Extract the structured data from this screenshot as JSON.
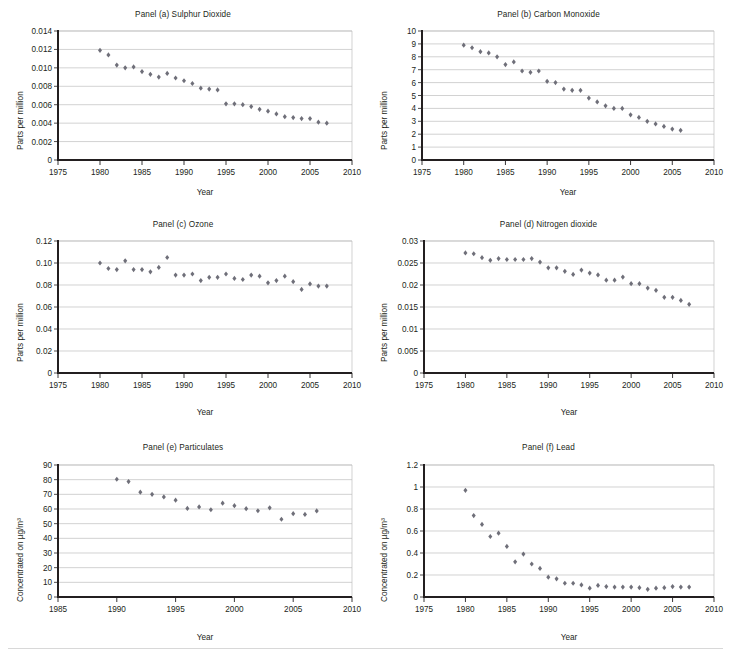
{
  "figure": {
    "axis_label_x": "Year",
    "marker_color": "#6f6f79",
    "axis_color": "#231f20",
    "grid_color": "#bfbfbf"
  },
  "chart_data": [
    {
      "id": "panel-a",
      "type": "scatter",
      "title": "Panel (a) Sulphur Dioxide",
      "xlabel": "Year",
      "ylabel": "Parts per million",
      "xlim": [
        1975,
        2010
      ],
      "ylim": [
        0,
        0.014
      ],
      "xticks": [
        1975,
        1980,
        1985,
        1990,
        1995,
        2000,
        2005,
        2010
      ],
      "yticks": [
        0,
        0.002,
        0.004,
        0.006,
        0.008,
        0.01,
        0.012,
        0.014
      ],
      "ytick_labels": [
        "0",
        "0.002",
        "0.004",
        "0.006",
        "0.008",
        "0.010",
        "0.012",
        "0.014"
      ],
      "grid": true,
      "legend": "none",
      "x": [
        1980,
        1981,
        1982,
        1983,
        1984,
        1985,
        1986,
        1987,
        1988,
        1989,
        1990,
        1991,
        1992,
        1993,
        1994,
        1995,
        1996,
        1997,
        1998,
        1999,
        2000,
        2001,
        2002,
        2003,
        2004,
        2005,
        2006,
        2007
      ],
      "y": [
        0.0119,
        0.0114,
        0.0103,
        0.01,
        0.0101,
        0.0096,
        0.0093,
        0.009,
        0.0094,
        0.0089,
        0.0086,
        0.0083,
        0.0078,
        0.0077,
        0.0076,
        0.0061,
        0.0061,
        0.006,
        0.0058,
        0.0055,
        0.0053,
        0.005,
        0.0047,
        0.0046,
        0.0045,
        0.0045,
        0.0041,
        0.004
      ]
    },
    {
      "id": "panel-b",
      "type": "scatter",
      "title": "Panel (b) Carbon Monoxide",
      "xlabel": "Year",
      "ylabel": "Parts per million",
      "xlim": [
        1975,
        2010
      ],
      "ylim": [
        0,
        10
      ],
      "xticks": [
        1975,
        1980,
        1985,
        1990,
        1995,
        2000,
        2005,
        2010
      ],
      "yticks": [
        0,
        1,
        2,
        3,
        4,
        5,
        6,
        7,
        8,
        9,
        10
      ],
      "ytick_labels": [
        "0",
        "1",
        "2",
        "3",
        "4",
        "5",
        "6",
        "7",
        "8",
        "9",
        "10"
      ],
      "grid": true,
      "legend": "none",
      "x": [
        1980,
        1981,
        1982,
        1983,
        1984,
        1985,
        1986,
        1987,
        1988,
        1989,
        1990,
        1991,
        1992,
        1993,
        1994,
        1995,
        1996,
        1997,
        1998,
        1999,
        2000,
        2001,
        2002,
        2003,
        2004,
        2005,
        2006
      ],
      "y": [
        8.9,
        8.7,
        8.4,
        8.3,
        8.0,
        7.4,
        7.6,
        6.9,
        6.8,
        6.9,
        6.1,
        6.0,
        5.5,
        5.4,
        5.4,
        4.8,
        4.5,
        4.2,
        4.0,
        4.0,
        3.5,
        3.3,
        3.0,
        2.8,
        2.6,
        2.4,
        2.3
      ]
    },
    {
      "id": "panel-c",
      "type": "scatter",
      "title": "Panel (c) Ozone",
      "xlabel": "Year",
      "ylabel": "Parts per million",
      "xlim": [
        1975,
        2010
      ],
      "ylim": [
        0,
        0.12
      ],
      "xticks": [
        1975,
        1980,
        1985,
        1990,
        1995,
        2000,
        2005,
        2010
      ],
      "yticks": [
        0,
        0.02,
        0.04,
        0.06,
        0.08,
        0.1,
        0.12
      ],
      "ytick_labels": [
        "0",
        "0.02",
        "0.04",
        "0.06",
        "0.08",
        "0.10",
        "0.12"
      ],
      "grid": true,
      "legend": "none",
      "x": [
        1980,
        1981,
        1982,
        1983,
        1984,
        1985,
        1986,
        1987,
        1988,
        1989,
        1990,
        1991,
        1992,
        1993,
        1994,
        1995,
        1996,
        1997,
        1998,
        1999,
        2000,
        2001,
        2002,
        2003,
        2004,
        2005,
        2006,
        2007
      ],
      "y": [
        0.1,
        0.095,
        0.094,
        0.102,
        0.094,
        0.094,
        0.092,
        0.096,
        0.105,
        0.089,
        0.089,
        0.09,
        0.084,
        0.087,
        0.087,
        0.09,
        0.086,
        0.085,
        0.089,
        0.088,
        0.082,
        0.084,
        0.088,
        0.083,
        0.076,
        0.081,
        0.079,
        0.079
      ]
    },
    {
      "id": "panel-d",
      "type": "scatter",
      "title": "Panel (d) Nitrogen dioxide",
      "xlabel": "Year",
      "ylabel": "Parts per million",
      "xlim": [
        1975,
        2010
      ],
      "ylim": [
        0,
        0.03
      ],
      "xticks": [
        1975,
        1980,
        1985,
        1990,
        1995,
        2000,
        2005,
        2010
      ],
      "yticks": [
        0,
        0.005,
        0.01,
        0.015,
        0.02,
        0.025,
        0.03
      ],
      "ytick_labels": [
        "0",
        "0.005",
        "0.01",
        "0.015",
        "0.02",
        "0.025",
        "0.03"
      ],
      "grid": true,
      "legend": "none",
      "x": [
        1980,
        1981,
        1982,
        1983,
        1984,
        1985,
        1986,
        1987,
        1988,
        1989,
        1990,
        1991,
        1992,
        1993,
        1994,
        1995,
        1996,
        1997,
        1998,
        1999,
        2000,
        2001,
        2002,
        2003,
        2004,
        2005,
        2006,
        2007
      ],
      "y": [
        0.0273,
        0.0271,
        0.0262,
        0.0256,
        0.026,
        0.0258,
        0.0258,
        0.0258,
        0.026,
        0.0252,
        0.0239,
        0.0239,
        0.0231,
        0.0224,
        0.0234,
        0.0227,
        0.0223,
        0.0211,
        0.0211,
        0.0218,
        0.0203,
        0.0203,
        0.0193,
        0.0188,
        0.0172,
        0.0172,
        0.0165,
        0.0156
      ]
    },
    {
      "id": "panel-e",
      "type": "scatter",
      "title": "Panel (e) Particulates",
      "xlabel": "Year",
      "ylabel": "Concentrated on µg/m³",
      "xlim": [
        1985,
        2010
      ],
      "ylim": [
        0,
        90
      ],
      "xticks": [
        1985,
        1990,
        1995,
        2000,
        2005,
        2010
      ],
      "yticks": [
        0,
        10,
        20,
        30,
        40,
        50,
        60,
        70,
        80,
        90
      ],
      "ytick_labels": [
        "0",
        "10",
        "20",
        "30",
        "40",
        "50",
        "60",
        "70",
        "80",
        "90"
      ],
      "grid": true,
      "legend": "none",
      "x": [
        1990,
        1991,
        1992,
        1993,
        1994,
        1995,
        1996,
        1997,
        1998,
        1999,
        2000,
        2001,
        2002,
        2003,
        2004,
        2005,
        2006,
        2007
      ],
      "y": [
        80.3,
        78.7,
        71.5,
        70.0,
        68.2,
        66.0,
        60.4,
        61.4,
        59.5,
        64.0,
        62.3,
        60.2,
        58.8,
        60.8,
        53.0,
        56.8,
        56.3,
        58.7
      ]
    },
    {
      "id": "panel-f",
      "type": "scatter",
      "title": "Panel (f) Lead",
      "xlabel": "Year",
      "ylabel": "Concentrated on µg/m³",
      "xlim": [
        1975,
        2010
      ],
      "ylim": [
        0,
        1.2
      ],
      "xticks": [
        1975,
        1980,
        1985,
        1990,
        1995,
        2000,
        2005,
        2010
      ],
      "yticks": [
        0,
        0.2,
        0.4,
        0.6,
        0.8,
        1,
        1.2
      ],
      "ytick_labels": [
        "0",
        "0.2",
        "0.4",
        "0.6",
        "0.8",
        "1",
        "1.2"
      ],
      "grid": true,
      "legend": "none",
      "x": [
        1980,
        1981,
        1982,
        1983,
        1984,
        1985,
        1986,
        1987,
        1988,
        1989,
        1990,
        1991,
        1992,
        1993,
        1994,
        1995,
        1996,
        1997,
        1998,
        1999,
        2000,
        2001,
        2002,
        2003,
        2004,
        2005,
        2006,
        2007
      ],
      "y": [
        0.97,
        0.74,
        0.66,
        0.55,
        0.58,
        0.46,
        0.32,
        0.39,
        0.3,
        0.26,
        0.18,
        0.165,
        0.125,
        0.125,
        0.11,
        0.08,
        0.105,
        0.095,
        0.09,
        0.09,
        0.09,
        0.085,
        0.07,
        0.08,
        0.085,
        0.095,
        0.09,
        0.09
      ]
    }
  ]
}
